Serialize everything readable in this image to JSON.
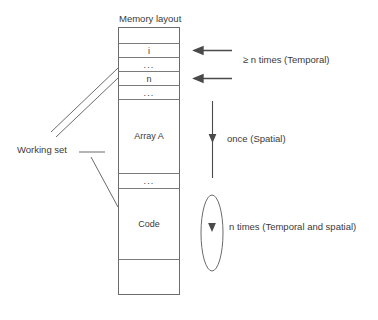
{
  "diagram": {
    "title": "Memory layout",
    "memory_box": {
      "name": "memory-layout-box",
      "rows": [
        {
          "id": "row-empty-top",
          "label": "",
          "kind": "empty"
        },
        {
          "id": "row-i",
          "label": "i",
          "kind": "variable"
        },
        {
          "id": "row-dots-1",
          "label": "...",
          "kind": "ellipsis"
        },
        {
          "id": "row-n",
          "label": "n",
          "kind": "variable"
        },
        {
          "id": "row-dots-2",
          "label": "...",
          "kind": "ellipsis"
        },
        {
          "id": "row-array-a",
          "label": "Array A",
          "kind": "region"
        },
        {
          "id": "row-dots-3",
          "label": "...",
          "kind": "ellipsis"
        },
        {
          "id": "row-code",
          "label": "Code",
          "kind": "region"
        },
        {
          "id": "row-empty-bottom",
          "label": "",
          "kind": "empty"
        }
      ]
    },
    "annotations": [
      {
        "id": "annotation-temporal",
        "label": "≥ n times (Temporal)",
        "marker": "double-left-arrow",
        "targets": [
          "row-i",
          "row-n"
        ]
      },
      {
        "id": "annotation-spatial",
        "label": "once (Spatial)",
        "marker": "down-arrow-line",
        "targets": [
          "row-array-a"
        ]
      },
      {
        "id": "annotation-temporal-spatial",
        "label": "n times (Temporal and spatial)",
        "marker": "loop-ellipse-down-arrow",
        "targets": [
          "row-code"
        ]
      }
    ],
    "working_set": {
      "id": "working-set",
      "label": "Working set",
      "leader": "horizontal-line-with-three-branches",
      "targets": [
        "row-i",
        "row-n",
        "row-code"
      ]
    },
    "colors": {
      "stroke": "#6b6b6b",
      "stroke_light": "#8a8a8a",
      "text": "#3a3a3a",
      "background": "#ffffff"
    }
  }
}
